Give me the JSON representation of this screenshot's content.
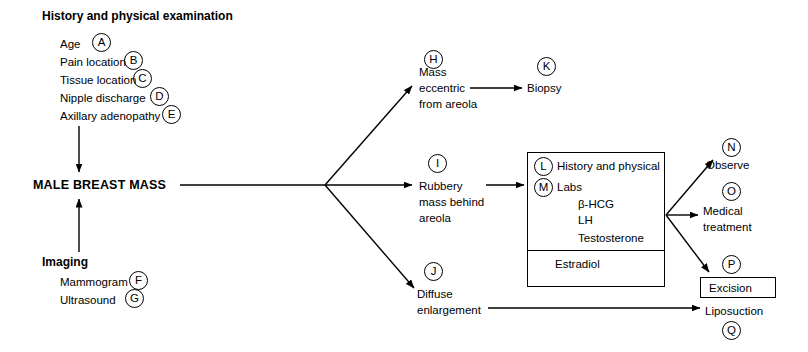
{
  "diagram": {
    "sections": {
      "history_heading": "History and physical examination",
      "imaging_heading": "Imaging",
      "central_node": "MALE BREAST MASS"
    },
    "history_items": [
      {
        "letter": "A",
        "label": "Age"
      },
      {
        "letter": "B",
        "label": "Pain location"
      },
      {
        "letter": "C",
        "label": "Tissue location"
      },
      {
        "letter": "D",
        "label": "Nipple discharge"
      },
      {
        "letter": "E",
        "label": "Axillary adenopathy"
      }
    ],
    "imaging_items": [
      {
        "letter": "F",
        "label": "Mammogram"
      },
      {
        "letter": "G",
        "label": "Ultrasound"
      }
    ],
    "branches": [
      {
        "letter": "H",
        "line1": "Mass",
        "line2": "eccentric",
        "line3": "from areola"
      },
      {
        "letter": "I",
        "line1": "Rubbery",
        "line2": "mass behind",
        "line3": "areola"
      },
      {
        "letter": "J",
        "line1": "Diffuse",
        "line2": "enlargement",
        "line3": ""
      }
    ],
    "biopsy": {
      "letter": "K",
      "label": "Biopsy"
    },
    "workup_box": {
      "rows": [
        {
          "letter": "L",
          "label": "History and physical"
        },
        {
          "letter": "M",
          "label": "Labs"
        }
      ],
      "labs": [
        "β-HCG",
        "LH",
        "Testosterone"
      ],
      "lower_cell": "Estradiol"
    },
    "outcomes": [
      {
        "letter": "N",
        "label": "Observe",
        "boxed": false
      },
      {
        "letter": "O",
        "line1": "Medical",
        "line2": "treatment",
        "boxed": false
      },
      {
        "letter": "P",
        "label": "Excision",
        "boxed": true
      },
      {
        "letter": "Q",
        "label": "Liposuction",
        "boxed": false
      }
    ],
    "colors": {
      "stroke": "#000000",
      "background": "#ffffff",
      "text": "#000000"
    }
  }
}
